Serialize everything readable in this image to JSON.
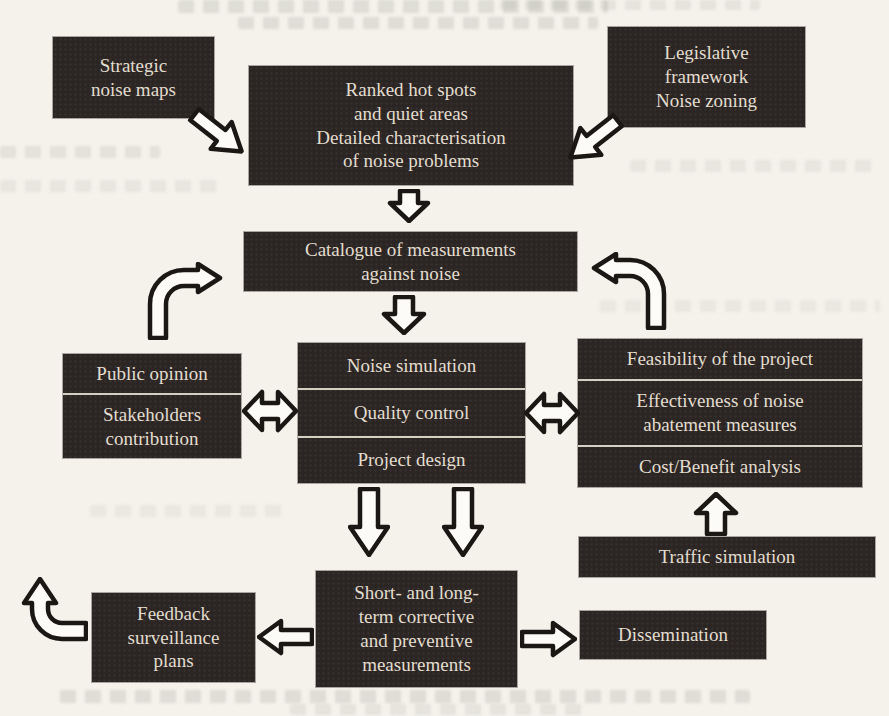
{
  "diagram_title": "Noise action planning flow diagram",
  "colors": {
    "paper": "#f5f2ec",
    "box_fill": "#2b2624",
    "box_text": "#e3ddcf",
    "arrow_fill": "#fcfbf7",
    "arrow_outline": "#1a1715",
    "divider": "#d4d0c3"
  },
  "boxes": {
    "strategic_noise_maps": "Strategic\nnoise maps",
    "ranked_hot_spots": "Ranked hot spots\nand quiet areas\nDetailed characterisation\nof noise problems",
    "legislative_framework": "Legislative\nframework\nNoise zoning",
    "catalogue": "Catalogue of measurements\nagainst noise",
    "public_opinion": "Public opinion",
    "stakeholders_contribution": "Stakeholders\ncontribution",
    "noise_simulation": "Noise simulation",
    "quality_control": "Quality control",
    "project_design": "Project design",
    "feasibility": "Feasibility of the project",
    "effectiveness": "Effectiveness of noise\nabatement measures",
    "cost_benefit": "Cost/Benefit analysis",
    "traffic_simulation": "Traffic simulation",
    "short_long_term": "Short- and long-\nterm corrective\nand preventive\nmeasurements",
    "feedback_plans": "Feedback\nsurveillance\nplans",
    "dissemination": "Dissemination"
  },
  "arrows": [
    {
      "name": "arrow-strategic-to-ranked-icon",
      "type": "hollow-arrow",
      "direction": "down-right"
    },
    {
      "name": "arrow-legislative-to-ranked-icon",
      "type": "hollow-arrow",
      "direction": "down-left"
    },
    {
      "name": "arrow-ranked-to-catalogue-icon",
      "type": "hollow-arrow",
      "direction": "down"
    },
    {
      "name": "arrow-catalogue-to-simulation-icon",
      "type": "hollow-arrow",
      "direction": "down"
    },
    {
      "name": "arrow-curved-left-icon",
      "type": "hollow-curved-arrow",
      "direction": "up-then-right"
    },
    {
      "name": "arrow-curved-right-icon",
      "type": "hollow-curved-arrow",
      "direction": "up-then-left"
    },
    {
      "name": "arrow-double-left-icon",
      "type": "hollow-double-arrow",
      "direction": "left-right"
    },
    {
      "name": "arrow-double-right-icon",
      "type": "hollow-double-arrow",
      "direction": "left-right"
    },
    {
      "name": "arrow-design-to-measures-left-icon",
      "type": "hollow-arrow",
      "direction": "down"
    },
    {
      "name": "arrow-design-to-measures-right-icon",
      "type": "hollow-arrow",
      "direction": "down"
    },
    {
      "name": "arrow-traffic-to-costbenefit-icon",
      "type": "hollow-arrow",
      "direction": "up"
    },
    {
      "name": "arrow-measures-to-feedback-icon",
      "type": "hollow-arrow",
      "direction": "left"
    },
    {
      "name": "arrow-measures-to-dissemination-icon",
      "type": "hollow-arrow",
      "direction": "right"
    },
    {
      "name": "arrow-feedback-loop-icon",
      "type": "hollow-curved-arrow",
      "direction": "left-then-up"
    }
  ]
}
